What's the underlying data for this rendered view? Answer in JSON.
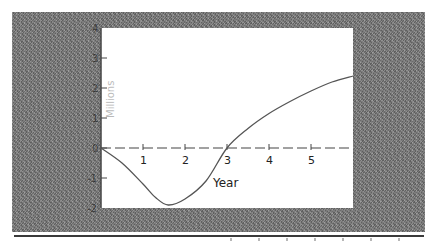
{
  "chart_data": {
    "type": "line",
    "title": "",
    "xlabel": "Year",
    "ylabel": "Millions",
    "xlim": [
      0,
      6
    ],
    "ylim": [
      -2,
      4
    ],
    "x_ticks": [
      1,
      2,
      3,
      4,
      5
    ],
    "x_tick_labels": [
      "1",
      "2",
      "3",
      "4",
      "5"
    ],
    "y_ticks": [
      -2,
      -1,
      0,
      1,
      2,
      3,
      4
    ],
    "y_tick_labels": [
      "-2",
      "-1",
      "0",
      "1",
      "2",
      "3",
      "4"
    ],
    "grid": false,
    "legend": null,
    "series": [
      {
        "name": "curve",
        "x": [
          0,
          0.5,
          1,
          1.3,
          1.6,
          2,
          2.5,
          3,
          3.5,
          4,
          4.5,
          5,
          5.5,
          6
        ],
        "values": [
          0,
          -0.5,
          -1.2,
          -1.65,
          -1.9,
          -1.7,
          -1.1,
          0,
          0.65,
          1.15,
          1.55,
          1.9,
          2.2,
          2.4
        ]
      }
    ],
    "colors": {
      "line": "#555555",
      "axis": "#444444",
      "plot_bg": "#ffffff",
      "frame": "#7a7a7a"
    }
  }
}
